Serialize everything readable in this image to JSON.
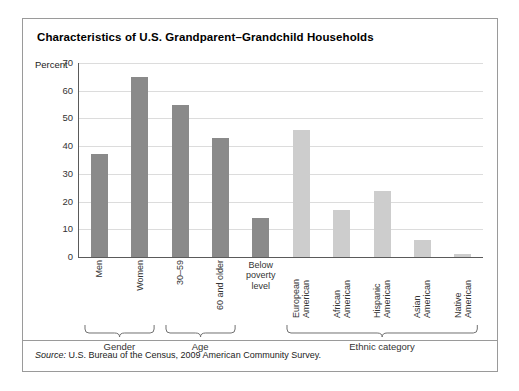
{
  "figure": {
    "title": "Characteristics of U.S. Grandparent–Grandchild Households",
    "source_keyword": "Source:",
    "source_text": " U.S. Bureau of the Census, 2009 American Community Survey."
  },
  "colors": {
    "bar_dark": "#8a8a8a",
    "bar_light": "#cdcdcd",
    "gridline": "#dcdcdc",
    "axis": "#5a5a5a",
    "frame": "#9a9a9a",
    "text": "#333333"
  },
  "chart_data": {
    "type": "bar",
    "title": "Characteristics of U.S. Grandparent–Grandchild Households",
    "xlabel": "",
    "ylabel": "Percent",
    "ylim": [
      0,
      70
    ],
    "yticks": [
      0,
      10,
      20,
      30,
      40,
      50,
      60,
      70
    ],
    "ytick_labels": [
      "0",
      "10",
      "20",
      "30",
      "40",
      "50",
      "60",
      "70"
    ],
    "grid": true,
    "legend": "none",
    "categories": [
      "Men",
      "Women",
      "30–59",
      "60 and older",
      "Below poverty level",
      "European American",
      "African American",
      "Hispanic American",
      "Asian American",
      "Native American"
    ],
    "values": [
      37,
      65,
      55,
      43,
      14,
      46,
      17,
      24,
      6,
      1
    ],
    "bar_shades": [
      "dark",
      "dark",
      "dark",
      "dark",
      "dark",
      "light",
      "light",
      "light",
      "light",
      "light"
    ],
    "label_orientation": [
      "vertical",
      "vertical",
      "vertical",
      "vertical",
      "horizontal",
      "vertical",
      "vertical",
      "vertical",
      "vertical",
      "vertical"
    ],
    "groups": [
      {
        "label": "Gender",
        "start_index": 0,
        "end_index": 1
      },
      {
        "label": "Age",
        "start_index": 2,
        "end_index": 3
      },
      {
        "label": "Ethnic category",
        "start_index": 5,
        "end_index": 9
      }
    ]
  }
}
